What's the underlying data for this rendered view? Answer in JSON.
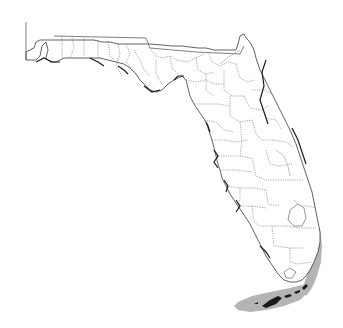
{
  "figure": {
    "type": "species-range-map",
    "region": "Florida",
    "subdivisions": "counties",
    "background_color": "#ffffff",
    "outline_color": "#3a3a3a",
    "county_line_color": "#6a6a6a",
    "range_color": "#b4b4b4",
    "range_description": "Shaded range along southeast Atlantic coast (Palm Beach to Miami-Dade) and Florida Keys"
  }
}
